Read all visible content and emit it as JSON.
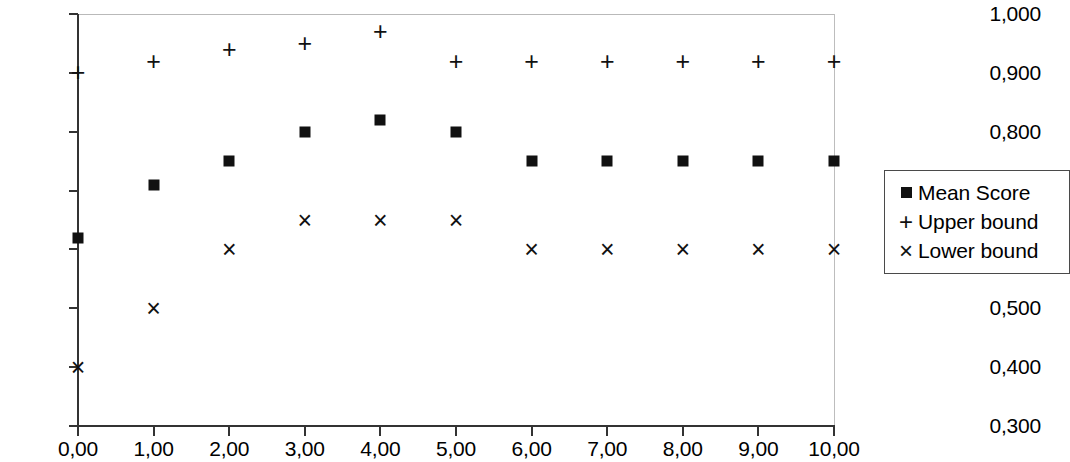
{
  "chart_data": {
    "type": "scatter",
    "title": "",
    "xlabel": "",
    "ylabel": "",
    "xlim": [
      0,
      10
    ],
    "ylim": [
      0.3,
      1.0
    ],
    "grid": false,
    "legend_position": "right",
    "decimal_separator": ",",
    "x": [
      0,
      1,
      2,
      3,
      4,
      5,
      6,
      7,
      8,
      9,
      10
    ],
    "x_tick_labels": [
      "0,00",
      "1,00",
      "2,00",
      "3,00",
      "4,00",
      "5,00",
      "6,00",
      "7,00",
      "8,00",
      "9,00",
      "10,00"
    ],
    "y_ticks": [
      0.3,
      0.4,
      0.5,
      0.6,
      0.7,
      0.8,
      0.9,
      1.0
    ],
    "y_tick_labels": [
      "0,300",
      "0,400",
      "0,500",
      "0,600",
      "0,700",
      "0,800",
      "0,900",
      "1,000"
    ],
    "series": [
      {
        "name": "Mean Score",
        "marker": "filled-square",
        "values": [
          0.62,
          0.71,
          0.75,
          0.8,
          0.82,
          0.8,
          0.75,
          0.75,
          0.75,
          0.75,
          0.75
        ]
      },
      {
        "name": "Upper bound",
        "marker": "plus",
        "values": [
          0.9,
          0.92,
          0.94,
          0.95,
          0.97,
          0.92,
          0.92,
          0.92,
          0.92,
          0.92,
          0.92
        ]
      },
      {
        "name": "Lower bound",
        "marker": "cross",
        "values": [
          0.4,
          0.5,
          0.6,
          0.65,
          0.65,
          0.65,
          0.6,
          0.6,
          0.6,
          0.6,
          0.6
        ]
      }
    ]
  },
  "legend": {
    "entries": [
      {
        "label": "Mean Score",
        "glyph": "square"
      },
      {
        "label": "Upper bound",
        "glyph": "plus"
      },
      {
        "label": "Lower bound",
        "glyph": "cross"
      }
    ]
  }
}
